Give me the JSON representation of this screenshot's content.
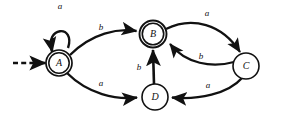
{
  "diagram": {
    "type": "state-machine",
    "stroke_color": "#111111",
    "fill_color": "#ffffff",
    "alphabet": [
      "a",
      "b"
    ],
    "start_state": "A",
    "accepting_states": [
      "A",
      "B"
    ]
  },
  "nodes": [
    {
      "id": "A",
      "label": "A",
      "cx": 59,
      "cy": 63,
      "r_outer": 13,
      "r_inner": 10.2,
      "accepting": true,
      "start": true
    },
    {
      "id": "B",
      "label": "B",
      "cx": 153,
      "cy": 34,
      "r_outer": 13.5,
      "r_inner": 10.7,
      "accepting": true,
      "start": false
    },
    {
      "id": "C",
      "label": "C",
      "cx": 246,
      "cy": 66,
      "r_outer": 13,
      "r_inner": 0,
      "accepting": false,
      "start": false
    },
    {
      "id": "D",
      "label": "D",
      "cx": 155,
      "cy": 97,
      "r_outer": 13,
      "r_inner": 0,
      "accepting": false,
      "start": false
    }
  ],
  "edges": [
    {
      "from": "A",
      "to": "A",
      "label": "a",
      "label_x": 60,
      "label_y": 7,
      "kind": "self-loop"
    },
    {
      "from": "A",
      "to": "B",
      "label": "b",
      "label_x": 101,
      "label_y": 28,
      "kind": "curve"
    },
    {
      "from": "B",
      "to": "C",
      "label": "a",
      "label_x": 207,
      "label_y": 14,
      "kind": "curve"
    },
    {
      "from": "C",
      "to": "B",
      "label": "b",
      "label_x": 201,
      "label_y": 57,
      "kind": "curve"
    },
    {
      "from": "C",
      "to": "D",
      "label": "a",
      "label_x": 208,
      "label_y": 86,
      "kind": "curve"
    },
    {
      "from": "D",
      "to": "B",
      "label": "b",
      "label_x": 139,
      "label_y": 68,
      "kind": "straight"
    },
    {
      "from": "A",
      "to": "D",
      "label": "a",
      "label_x": 101,
      "label_y": 84,
      "kind": "curve"
    }
  ],
  "start_arrow": {
    "name": "start-arrow",
    "style": "dashed",
    "from_x": 13,
    "to_x": 43,
    "y": 63
  }
}
